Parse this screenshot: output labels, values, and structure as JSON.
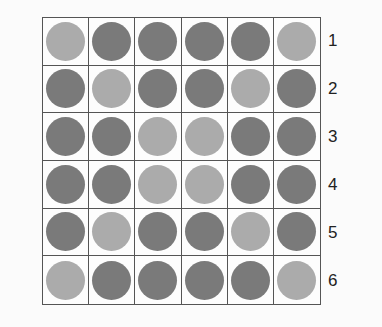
{
  "colors": {
    "dark": "#7a7a7a",
    "light": "#ababab"
  },
  "row_labels": [
    "1",
    "2",
    "3",
    "4",
    "5",
    "6"
  ],
  "grid": [
    [
      "light",
      "dark",
      "dark",
      "dark",
      "dark",
      "light"
    ],
    [
      "dark",
      "light",
      "dark",
      "dark",
      "light",
      "dark"
    ],
    [
      "dark",
      "dark",
      "light",
      "light",
      "dark",
      "dark"
    ],
    [
      "dark",
      "dark",
      "light",
      "light",
      "dark",
      "dark"
    ],
    [
      "dark",
      "light",
      "dark",
      "dark",
      "light",
      "dark"
    ],
    [
      "light",
      "dark",
      "dark",
      "dark",
      "dark",
      "light"
    ]
  ]
}
